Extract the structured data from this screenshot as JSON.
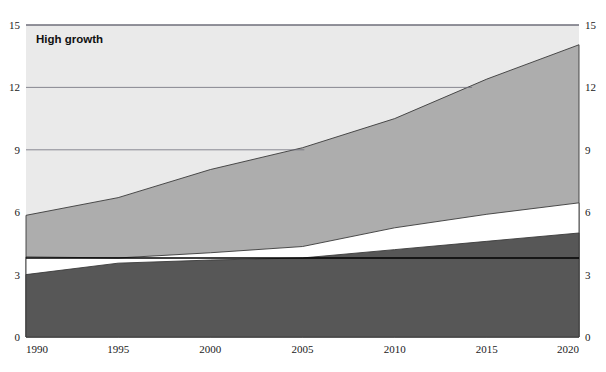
{
  "chart_data": {
    "type": "area",
    "stacked": true,
    "title": "High growth",
    "xlabel": "",
    "ylabel": "",
    "x": [
      1990,
      1995,
      2000,
      2005,
      2010,
      2015,
      2020
    ],
    "xlim": [
      1990,
      2020
    ],
    "ylim": [
      0,
      15
    ],
    "xticks": [
      "1990",
      "1995",
      "2000",
      "2005",
      "2010",
      "2015",
      "2020"
    ],
    "yticks_left": [
      "0",
      "3",
      "6",
      "9",
      "12",
      "15"
    ],
    "yticks_right": [
      "0",
      "3",
      "6",
      "9",
      "12",
      "15"
    ],
    "ytick_values": [
      0,
      3,
      6,
      9,
      12,
      15
    ],
    "gridlines": [
      {
        "value": 15,
        "span_x": [
          1990,
          2020
        ]
      },
      {
        "value": 12,
        "span_x": [
          1990,
          2014.2
        ]
      },
      {
        "value": 9,
        "span_x": [
          1990,
          2005.1
        ]
      }
    ],
    "series": [
      {
        "name": "band-1-dark",
        "color": "#575757",
        "values": [
          3.0,
          3.55,
          3.7,
          3.8,
          4.2,
          4.6,
          5.0
        ]
      },
      {
        "name": "band-2-white",
        "color": "#ffffff",
        "values": [
          0.85,
          0.25,
          0.35,
          0.55,
          1.05,
          1.3,
          1.45
        ]
      },
      {
        "name": "band-3-medium",
        "color": "#adadad",
        "values": [
          2.0,
          2.9,
          4.0,
          4.75,
          5.25,
          6.5,
          7.6
        ]
      },
      {
        "name": "band-4-light",
        "color": "#eaeaea",
        "values": [
          9.15,
          8.3,
          6.95,
          5.9,
          4.5,
          2.6,
          0.95
        ]
      }
    ],
    "cumulative_tops": {
      "band_1_dark": [
        3.0,
        3.55,
        3.7,
        3.8,
        4.2,
        4.6,
        5.0
      ],
      "band_2_white": [
        3.85,
        3.8,
        4.05,
        4.35,
        5.25,
        5.9,
        6.45
      ],
      "band_3_medium": [
        5.85,
        6.7,
        8.05,
        9.1,
        10.5,
        12.4,
        14.05
      ],
      "band_4_light": [
        15.0,
        15.0,
        15.0,
        15.0,
        15.0,
        15.0,
        15.0
      ]
    },
    "reference_line": {
      "name": "baseline-3.8",
      "value": 3.8,
      "color": "#000000"
    },
    "legend": {
      "visible": false,
      "position": "none"
    },
    "grid": true
  },
  "colors": {
    "band_dark": "#575757",
    "band_white": "#ffffff",
    "band_medium": "#adadad",
    "band_light": "#eaeaea",
    "gridline": "#6e6e7a",
    "outline": "#3a3a3a",
    "reference_line": "#000000",
    "text": "#1a1a1a"
  }
}
